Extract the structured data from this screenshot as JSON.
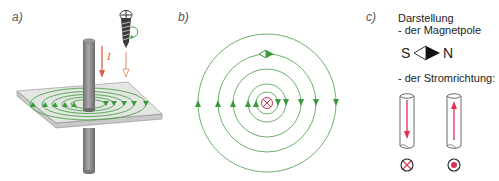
{
  "panels": {
    "a": {
      "label": "a)",
      "current_symbol": "I"
    },
    "b": {
      "label": "b)"
    },
    "c": {
      "label": "c)",
      "title": "Darstellung",
      "magnet_heading": "- der Magnetpole",
      "south": "S",
      "north": "N",
      "current_heading": "- der Stromrichtung:"
    }
  },
  "colors": {
    "field_lines": "#3a9a3a",
    "current": "#e0304a",
    "conductor": "#8a8a8a",
    "plate": "#d8d8d8"
  }
}
